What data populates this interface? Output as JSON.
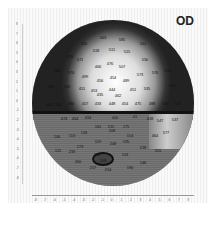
{
  "title": "OD",
  "map": {
    "type": "visual-field-grayscale",
    "points": [
      {
        "x": 103,
        "y": 37,
        "v": "563"
      },
      {
        "x": 122,
        "y": 39,
        "v": "585"
      },
      {
        "x": 84,
        "y": 43,
        "v": "560"
      },
      {
        "x": 143,
        "y": 43,
        "v": "561"
      },
      {
        "x": 96,
        "y": 50,
        "v": "518"
      },
      {
        "x": 112,
        "y": 49,
        "v": "511"
      },
      {
        "x": 127,
        "y": 51,
        "v": "515"
      },
      {
        "x": 70,
        "y": 56,
        "v": "535"
      },
      {
        "x": 80,
        "y": 59,
        "v": "571"
      },
      {
        "x": 145,
        "y": 59,
        "v": "530"
      },
      {
        "x": 98,
        "y": 66,
        "v": "466"
      },
      {
        "x": 110,
        "y": 63,
        "v": "476"
      },
      {
        "x": 122,
        "y": 66,
        "v": "507"
      },
      {
        "x": 57,
        "y": 70,
        "v": "586"
      },
      {
        "x": 71,
        "y": 72,
        "v": "574"
      },
      {
        "x": 140,
        "y": 74,
        "v": "573"
      },
      {
        "x": 155,
        "y": 72,
        "v": "576"
      },
      {
        "x": 168,
        "y": 70,
        "v": "552"
      },
      {
        "x": 85,
        "y": 76,
        "v": "499"
      },
      {
        "x": 100,
        "y": 80,
        "v": "456"
      },
      {
        "x": 113,
        "y": 77,
        "v": "454"
      },
      {
        "x": 126,
        "y": 80,
        "v": "489"
      },
      {
        "x": 51,
        "y": 86,
        "v": "569"
      },
      {
        "x": 67,
        "y": 86,
        "v": "532"
      },
      {
        "x": 82,
        "y": 88,
        "v": "451"
      },
      {
        "x": 94,
        "y": 90,
        "v": "453"
      },
      {
        "x": 112,
        "y": 89,
        "v": "444"
      },
      {
        "x": 133,
        "y": 89,
        "v": "451"
      },
      {
        "x": 147,
        "y": 88,
        "v": "535"
      },
      {
        "x": 172,
        "y": 85,
        "v": "555"
      },
      {
        "x": 100,
        "y": 94,
        "v": "435"
      },
      {
        "x": 118,
        "y": 95,
        "v": "462"
      },
      {
        "x": 49,
        "y": 104,
        "v": "545"
      },
      {
        "x": 58,
        "y": 104,
        "v": "550"
      },
      {
        "x": 71,
        "y": 103,
        "v": "483"
      },
      {
        "x": 85,
        "y": 103,
        "v": "457"
      },
      {
        "x": 98,
        "y": 103,
        "v": "433"
      },
      {
        "x": 112,
        "y": 103,
        "v": "448"
      },
      {
        "x": 125,
        "y": 103,
        "v": "454"
      },
      {
        "x": 138,
        "y": 103,
        "v": "475"
      },
      {
        "x": 152,
        "y": 103,
        "v": "488"
      },
      {
        "x": 165,
        "y": 103,
        "v": "539"
      },
      {
        "x": 178,
        "y": 103,
        "v": "553"
      },
      {
        "x": 103,
        "y": 112,
        "v": "420"
      },
      {
        "x": 118,
        "y": 112,
        "v": "436"
      },
      {
        "x": 64,
        "y": 118,
        "v": "474"
      },
      {
        "x": 75,
        "y": 118,
        "v": "454"
      },
      {
        "x": 88,
        "y": 117,
        "v": "414"
      },
      {
        "x": 115,
        "y": 117,
        "v": "400"
      },
      {
        "x": 135,
        "y": 116,
        "v": "41"
      },
      {
        "x": 150,
        "y": 118,
        "v": "418"
      },
      {
        "x": 160,
        "y": 120,
        "v": "547"
      },
      {
        "x": 175,
        "y": 119,
        "v": "537"
      },
      {
        "x": 98,
        "y": 126,
        "v": "161"
      },
      {
        "x": 111,
        "y": 126,
        "v": "215"
      },
      {
        "x": 126,
        "y": 126,
        "v": "175"
      },
      {
        "x": 57,
        "y": 136,
        "v": "206"
      },
      {
        "x": 72,
        "y": 135,
        "v": "113"
      },
      {
        "x": 84,
        "y": 132,
        "v": "133"
      },
      {
        "x": 112,
        "y": 130,
        "v": "208"
      },
      {
        "x": 130,
        "y": 135,
        "v": "114"
      },
      {
        "x": 155,
        "y": 135,
        "v": "464"
      },
      {
        "x": 166,
        "y": 132,
        "v": "577"
      },
      {
        "x": 98,
        "y": 141,
        "v": "119"
      },
      {
        "x": 113,
        "y": 143,
        "v": "208"
      },
      {
        "x": 126,
        "y": 141,
        "v": "135"
      },
      {
        "x": 58,
        "y": 150,
        "v": "121"
      },
      {
        "x": 80,
        "y": 146,
        "v": "273"
      },
      {
        "x": 143,
        "y": 147,
        "v": "218"
      },
      {
        "x": 158,
        "y": 150,
        "v": "551"
      },
      {
        "x": 72,
        "y": 151,
        "v": "233"
      },
      {
        "x": 97,
        "y": 154,
        "v": "124"
      },
      {
        "x": 125,
        "y": 154,
        "v": "153"
      },
      {
        "x": 78,
        "y": 161,
        "v": "260"
      },
      {
        "x": 103,
        "y": 160,
        "v": "118"
      },
      {
        "x": 143,
        "y": 162,
        "v": "146"
      },
      {
        "x": 93,
        "y": 167,
        "v": "217"
      },
      {
        "x": 108,
        "y": 169,
        "v": "214"
      },
      {
        "x": 130,
        "y": 167,
        "v": "196"
      }
    ]
  },
  "axes": {
    "x_ticks": [
      "-8",
      "-7",
      "-6",
      "-5",
      "-4",
      "-3",
      "-2",
      "-1",
      "0",
      "1",
      "2",
      "3",
      "4",
      "5",
      "6",
      "7",
      "8"
    ],
    "y_ticks": [
      "8",
      "7",
      "6",
      "5",
      "4",
      "3",
      "2",
      "1",
      "0",
      "-1",
      "-2",
      "-3",
      "-4",
      "-5",
      "-6",
      "-7",
      "-8"
    ]
  }
}
